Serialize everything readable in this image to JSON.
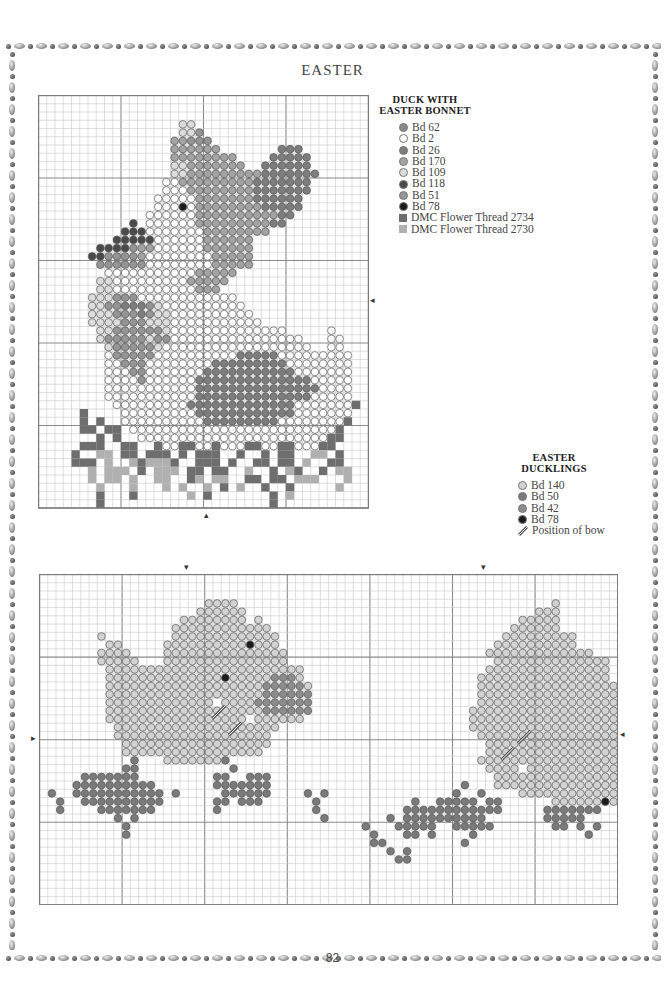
{
  "page": {
    "title": "EASTER",
    "page_number": "82"
  },
  "colors": {
    "grid_minor": "#c9c9c9",
    "grid_major": "#8a8a8a",
    "border": "#7a7a7a"
  },
  "legends": {
    "duck": {
      "title_line1": "DUCK WITH",
      "title_line2": "EASTER BONNET",
      "items": [
        {
          "key": "a",
          "label": "Bd 62",
          "shape": "circle",
          "color": "#8a8a8a"
        },
        {
          "key": "b",
          "label": "Bd 2",
          "shape": "circle",
          "color": "#ffffff"
        },
        {
          "key": "c",
          "label": "Bd 26",
          "shape": "circle",
          "color": "#7d7d7d"
        },
        {
          "key": "d",
          "label": "Bd 170",
          "shape": "circle",
          "color": "#a3a3a3"
        },
        {
          "key": "e",
          "label": "Bd 109",
          "shape": "circle",
          "color": "#dcdcdc"
        },
        {
          "key": "f",
          "label": "Bd 118",
          "shape": "circle",
          "color": "#4a4a4a"
        },
        {
          "key": "g",
          "label": "Bd 51",
          "shape": "circle",
          "color": "#959595"
        },
        {
          "key": "h",
          "label": "Bd 78",
          "shape": "circle",
          "color": "#1c1c1c"
        },
        {
          "key": "S",
          "label": "DMC Flower Thread 2734",
          "shape": "square",
          "color": "#6e6e6e"
        },
        {
          "key": "T",
          "label": "DMC Flower Thread 2730",
          "shape": "square",
          "color": "#b0b0b0"
        }
      ]
    },
    "ducklings": {
      "title_line1": "EASTER",
      "title_line2": "DUCKLINGS",
      "items": [
        {
          "key": "l",
          "label": "Bd 140",
          "shape": "circle",
          "color": "#d2d2d2"
        },
        {
          "key": "m",
          "label": "Bd 50",
          "shape": "circle",
          "color": "#7a7a7a"
        },
        {
          "key": "n",
          "label": "Bd 42",
          "shape": "circle",
          "color": "#8c8c8c"
        },
        {
          "key": "h",
          "label": "Bd 78",
          "shape": "circle",
          "color": "#1c1c1c"
        },
        {
          "key": "bow",
          "label": "Position of bow",
          "shape": "bow",
          "color": "#555555"
        }
      ]
    }
  },
  "charts": {
    "duck": {
      "cols": 40,
      "rows": 50,
      "cell": 8.25,
      "major_every": 10,
      "rows_data": [
        "........................................",
        "........................................",
        "........................................",
        ".................ee.....................",
        ".................eeg....................",
        "................ddggg...................",
        "................dddddd.......ccc........",
        "................dddddddd....ccccc.......",
        "................eeddddddd..cccccc.......",
        "................eedddddddddccccccc......",
        "...............bbdddddddddccccccc.......",
        "...............bbbddddddddccccccc.......",
        "..............bbbbbdddddddcccccc........",
        "..............bbbhbddddddddccccc........",
        ".............bbbbbbddddddddddcc.........",
        "...........f.bbbbbbdddddddddcc..........",
        "..........fffbbbbbbbdddddddd............",
        ".........fffffbbbbbbdddddd..............",
        ".......ffffgddbbbbbbdddddd..............",
        "......ffggggdbbbbbbbbddddd..............",
        ".......ggggggbbbbbbbbddddd..............",
        "........bbbbbbbbbbbddddd................",
        ".......eebbbbbbbbbddddd.................",
        ".......eebbbbbbbbbbddd..................",
        "......eeegggbbbbbbbbbbbb................",
        "......eeggcccgebbbbbbbbbb...............",
        "......eeegggcgeebbbbbbbbbb..............",
        "......eeeegggeeebbbbbbbbbbb.............",
        ".......eeggggggebbbbbbbbbbbbbb.....b....",
        ".......egggggeggbbbbbbbbbbbbbbbb...bb...",
        "........egggggebbbbbbbbbbbbbbbbbb..bb...",
        "........bgggggbbbbbbbbbbcccccbbbbbbbbb..",
        "........bbgggbbbbbbbbcccccccccbbbbbbbb..",
        "........bbbggbbbbbbbcccccccccccbbbbbbb..",
        "........bbbbgbbbbbbccccccccccccccbbbbb..",
        "........bbbbbbbbbbbcccccccccccccccbbbb..",
        "........bbbbbbbbbbbccccccccccccccbbbbb..",
        ".........bbbbbbbbbcccccccccccccbbbbbbbS.",
        ".....S....bbbbbbbbbccccccccccccbbbbbbb..",
        ".....S.S..bbbbbbbbbbcccccccccbbbbbbbbS..",
        ".....SS.SS.bbbbbbbbbbbbbbbbbbbbbbbbbS...",
        ".......S.S..bbbbbbbbbbbbbbbbbbbbbbbSS...",
        ".....SSS..SS..SbbSSbbSbbbSSbbSSbbbSS....",
        "....S..TT.SS.SSS.S.SSS..S..S.SS..TT.S...",
        "....SSS.T..TSTTTS..SSS.S..SS.SS.T..SS...",
        "......T.TTT.S.TTT.SS.SS..T..S.TS..S.TT..",
        "......T.TT.T..TT..ST.TT..SS.SS.TTT...T..",
        ".......T...T...T.T..T.S.T..S..S.....T...",
        ".......S...S......T.S.......S.T.........",
        ".......S....................S..........."
      ]
    },
    "ducklings": {
      "cols": 70,
      "rows": 40,
      "cell": 8.26,
      "major_every": 10,
      "rows_data": [
        "......................................................................",
        "......................................................................",
        "......................................................................",
        "....................llll......................................l.......",
        "...................llllll...................................lll.......",
        ".................llllllll.l...............................lllll.......",
        "................llllllllllll.............................llllll.......",
        ".......l........lllllllllllll...........................lllllllll.....",
        "........ll.....llllllllllhlll..........................llllllllll.....",
        ".......llll....lllllllllllllll........................lllllllllllll...",
        ".......lllll...lllllllllllllll.........................llllllllllllll.",
        "........llllllllllllllllllllllll......................lllllllllllllll.",
        "........llllllllllllllhlllllnnnl.....................llllllllllllllll.",
        "........lllllllllllllllllllnnnnnl....................lllllllllllllllll",
        "........lllllllllllllllllllnnnnnn....................lllllllllllllllll",
        "........lllllllllllll.llllnnnnnnn....................llllllllllllllllll",
        "........lllllllllllllllllllnnnnnn...................lllllllllllllllllll",
        "........lllllllllllllllll.llllll....................lllllllllllllllllll",
        ".........llllllllllllllllllll.......................llllllllllllllllllll",
        ".........lllllllllllllllllll.........................lllllllllllllllllll",
        "..........llllllllllllllllll..........................llllllllllllllllll",
        "..........lllllllllllllllll...........................lllllllllllllllllll",
        "...........m...lllllllm..............................llllllllllllllllllll",
        "..........mm...........m..............................llll.lllllllllllll",
        ".....mmmmmmm.........mm..mmm...........................lllllllllllllllll",
        "....mmmmmmmmmm.......mmmmmmm.......................m...lllllllllllllllll",
        ".m..mmmmmmmmmmm.m.....mmmmmm....m.m...............m..m....llllllllllllll",
        "..m..mmmmmmmmmm......mm.mmm......m...........m..mmmmm.mm......llllllhll",
        "..m....mmmmmmm.......m...........m..........mmmmmmmmmmmm.....mmmmmmm..",
        ".........m.m......................m.......m.mmmmmmmmmm.......mmmmm....",
        "..........m............................m...mmmmm..mmmmm.......mm.m.m..",
        "..........m.............................m...mm.m....m.............m...",
        "........................................mm.........m................",
        "..........................................m.m.......................",
        "...........................................mm.......................",
        "......................................................................",
        "......................................................................",
        "......................................................................",
        "......................................................................",
        "......................................................................"
      ],
      "bows": [
        [
          21,
          16
        ],
        [
          23,
          18
        ],
        [
          56,
          21
        ],
        [
          58,
          19
        ]
      ]
    }
  },
  "arrows": {
    "duck_right": "◂",
    "duck_left": "▸",
    "duck_bottom": "▴",
    "ducklings_top_1": "▾",
    "ducklings_top_2": "▾",
    "ducklings_left": "▸",
    "ducklings_right": "◂"
  }
}
